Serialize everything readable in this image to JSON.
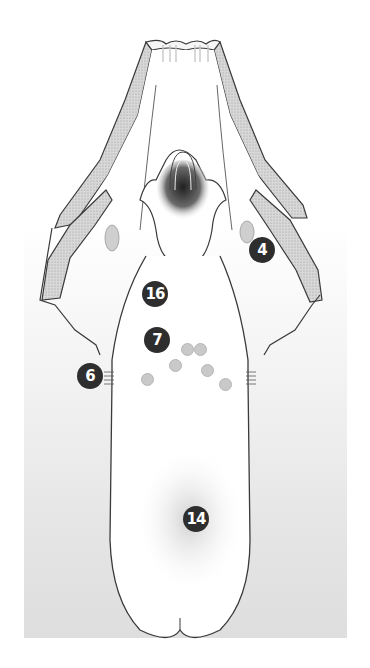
{
  "figure": {
    "background": {
      "top": "#ffffff",
      "bottom": "#dedede"
    },
    "colors": {
      "outline": "#3a3a3a",
      "stipple": "#bdbdbd",
      "badge": "#2e2e2e",
      "badge_text": "#ffffff"
    },
    "labels": [
      {
        "id": "label-4",
        "text": "4",
        "x": 249,
        "y": 237
      },
      {
        "id": "label-16",
        "text": "16",
        "x": 142,
        "y": 281
      },
      {
        "id": "label-7",
        "text": "7",
        "x": 144,
        "y": 327
      },
      {
        "id": "label-6",
        "text": "6",
        "x": 77,
        "y": 363
      },
      {
        "id": "label-14",
        "text": "14",
        "x": 183,
        "y": 506
      }
    ],
    "minor_markers": [
      {
        "x": 181,
        "y": 343
      },
      {
        "x": 194,
        "y": 343
      },
      {
        "x": 169,
        "y": 359
      },
      {
        "x": 201,
        "y": 364
      },
      {
        "x": 141,
        "y": 373
      },
      {
        "x": 219,
        "y": 378
      }
    ]
  }
}
